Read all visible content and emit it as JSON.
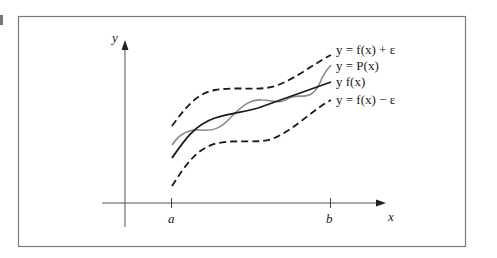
{
  "figure": {
    "axes": {
      "x_label": "x",
      "y_label": "y"
    },
    "ticks": {
      "a": "a",
      "b": "b"
    },
    "legend": [
      {
        "id": "upper",
        "label": "y = f(x) + ε",
        "style": "dashed",
        "color": "#1a1a1a"
      },
      {
        "id": "poly",
        "label": "y = P(x)",
        "style": "solid",
        "color": "#8a8a8a"
      },
      {
        "id": "func",
        "label": "y f(x)",
        "style": "solid",
        "color": "#1a1a1a"
      },
      {
        "id": "lower",
        "label": "y = f(x) − ε",
        "style": "dashed",
        "color": "#1a1a1a"
      }
    ]
  }
}
